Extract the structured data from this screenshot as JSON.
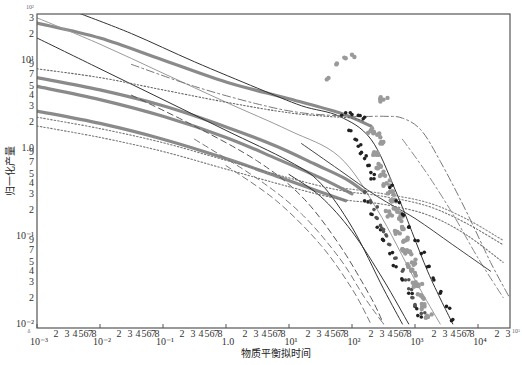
{
  "chart_data": {
    "type": "scatter",
    "title": "",
    "xlabel": "物质平衡拟时间",
    "ylabel": "归一化产量",
    "xscale": "log",
    "yscale": "log",
    "xlim": [
      0.001,
      30000
    ],
    "ylim": [
      0.01,
      34
    ],
    "grid": false,
    "legend": null,
    "x_major_ticks": [
      "10⁻³",
      "10⁻²",
      "10⁻¹",
      "1.0",
      "10¹",
      "10²",
      "10³",
      "10⁴"
    ],
    "x_minor_tick_labels": [
      "2",
      "3",
      "4",
      "5",
      "6",
      "7",
      "8"
    ],
    "x_trailing_minor_labels": [
      "2",
      "3"
    ],
    "y_major_ticks": [
      "10¹",
      "1.0",
      "10⁻¹",
      "10⁻²"
    ],
    "y_minor_tick_labels_per_decade": [
      "2",
      "3",
      "4",
      "5",
      "7",
      "9"
    ],
    "corner_marks": {
      "origin": "δ",
      "top_left": "10²",
      "bottom_right": "10⁵"
    },
    "series_note": "Type-curve family (solid thick gray, thin solid, dashed, dotted, dash-dot) with field data scatter (black, dark gray, light gray points); coordinates given as [log10(x), log10(y)]",
    "series": [
      {
        "name": "thick-gray-1",
        "style": "thick",
        "color": "#8a8a8a",
        "points": [
          [
            -3,
            0.42
          ],
          [
            -2,
            0.28
          ],
          [
            -1,
            0.1
          ],
          [
            0,
            -0.12
          ],
          [
            0.8,
            -0.32
          ],
          [
            1.5,
            -0.5
          ],
          [
            1.9,
            -0.6
          ]
        ]
      },
      {
        "name": "thick-gray-2",
        "style": "thick",
        "color": "#8a8a8a",
        "points": [
          [
            -3,
            0.8
          ],
          [
            -2,
            0.66
          ],
          [
            -1,
            0.48
          ],
          [
            0,
            0.24
          ],
          [
            0.8,
            0.02
          ],
          [
            1.4,
            -0.18
          ],
          [
            1.9,
            -0.35
          ],
          [
            2.2,
            -0.5
          ]
        ]
      },
      {
        "name": "thick-gray-3",
        "style": "thick",
        "color": "#8a8a8a",
        "points": [
          [
            -3,
            0.7
          ],
          [
            -2,
            0.55
          ],
          [
            -1,
            0.36
          ],
          [
            0,
            0.12
          ],
          [
            0.8,
            -0.12
          ],
          [
            1.5,
            -0.34
          ],
          [
            2.0,
            -0.52
          ]
        ]
      },
      {
        "name": "thick-gray-4",
        "style": "thick",
        "color": "#8a8a8a",
        "points": [
          [
            -3,
            1.42
          ],
          [
            -2,
            1.25
          ],
          [
            -1,
            1.0
          ],
          [
            0,
            0.75
          ],
          [
            1.0,
            0.56
          ],
          [
            1.8,
            0.4
          ],
          [
            2.3,
            0.25
          ]
        ]
      },
      {
        "name": "solid-black-1",
        "style": "thin",
        "color": "#333333",
        "points": [
          [
            -2.4,
            1.55
          ],
          [
            -1.5,
            1.3
          ],
          [
            -0.5,
            0.98
          ],
          [
            0.5,
            0.68
          ],
          [
            1.2,
            0.48
          ],
          [
            1.8,
            0.36
          ],
          [
            2.3,
            0.1
          ],
          [
            2.7,
            -0.5
          ],
          [
            3.2,
            -1.4
          ],
          [
            3.6,
            -2.0
          ]
        ]
      },
      {
        "name": "solid-black-2",
        "style": "thin",
        "color": "#333333",
        "points": [
          [
            -3,
            1.25
          ],
          [
            -2,
            0.9
          ],
          [
            -1,
            0.55
          ],
          [
            0,
            0.2
          ],
          [
            1,
            -0.15
          ],
          [
            1.5,
            -0.4
          ],
          [
            2.0,
            -0.9
          ],
          [
            2.5,
            -1.6
          ],
          [
            2.8,
            -2.0
          ]
        ]
      },
      {
        "name": "solid-black-3",
        "style": "thin",
        "color": "#333333",
        "points": [
          [
            1.0,
            -0.3
          ],
          [
            1.5,
            -0.55
          ],
          [
            2.0,
            -0.95
          ],
          [
            2.5,
            -1.5
          ],
          [
            2.9,
            -2.0
          ]
        ]
      },
      {
        "name": "thin-gray-1",
        "style": "thin",
        "color": "#9a9a9a",
        "points": [
          [
            -3,
            1.48
          ],
          [
            -2,
            1.18
          ],
          [
            -1,
            0.85
          ],
          [
            0,
            0.52
          ],
          [
            1,
            0.2
          ],
          [
            1.8,
            -0.1
          ],
          [
            2.4,
            -0.7
          ],
          [
            3.0,
            -1.5
          ],
          [
            3.4,
            -2.0
          ]
        ]
      },
      {
        "name": "dashed-1",
        "style": "dashed",
        "color": "#555555",
        "points": [
          [
            -1.5,
            0.6
          ],
          [
            -0.5,
            0.25
          ],
          [
            0.5,
            -0.15
          ],
          [
            1.2,
            -0.55
          ],
          [
            1.8,
            -1.1
          ],
          [
            2.3,
            -1.7
          ],
          [
            2.5,
            -2.0
          ]
        ]
      },
      {
        "name": "dashed-2",
        "style": "dashed",
        "color": "#777777",
        "points": [
          [
            -0.5,
            0.1
          ],
          [
            0.5,
            -0.35
          ],
          [
            1.2,
            -0.75
          ],
          [
            1.8,
            -1.25
          ],
          [
            2.2,
            -1.7
          ],
          [
            2.5,
            -2.0
          ]
        ]
      },
      {
        "name": "dashed-3",
        "style": "dashed",
        "color": "#777777",
        "points": [
          [
            0.0,
            -0.2
          ],
          [
            0.8,
            -0.6
          ],
          [
            1.5,
            -1.1
          ],
          [
            2.0,
            -1.6
          ],
          [
            2.3,
            -2.0
          ]
        ]
      },
      {
        "name": "dotted-1",
        "style": "dotted",
        "color": "#666666",
        "points": [
          [
            -3,
            0.9
          ],
          [
            -2,
            0.8
          ],
          [
            -1,
            0.66
          ],
          [
            0,
            0.52
          ],
          [
            1,
            0.4
          ],
          [
            1.6,
            0.36
          ],
          [
            2.0,
            0.34
          ],
          [
            2.2,
            0.3
          ]
        ]
      },
      {
        "name": "dotted-2",
        "style": "dotted",
        "color": "#777777",
        "points": [
          [
            -3,
            0.35
          ],
          [
            -2,
            0.22
          ],
          [
            -1,
            0.06
          ],
          [
            0,
            -0.14
          ],
          [
            1,
            -0.34
          ],
          [
            1.8,
            -0.48
          ],
          [
            2.5,
            -0.55
          ],
          [
            3.2,
            -0.66
          ],
          [
            3.8,
            -0.85
          ],
          [
            4.4,
            -1.1
          ]
        ]
      },
      {
        "name": "dotted-3",
        "style": "dotted",
        "color": "#777777",
        "points": [
          [
            -3,
            0.25
          ],
          [
            -2,
            0.12
          ],
          [
            -1,
            -0.04
          ],
          [
            0,
            -0.24
          ],
          [
            1,
            -0.44
          ],
          [
            1.8,
            -0.58
          ],
          [
            2.5,
            -0.64
          ],
          [
            3.2,
            -0.76
          ],
          [
            3.8,
            -0.98
          ],
          [
            4.4,
            -1.3
          ]
        ]
      },
      {
        "name": "dotted-4",
        "style": "dotted",
        "color": "#888888",
        "points": [
          [
            1.8,
            -0.45
          ],
          [
            2.5,
            -0.52
          ],
          [
            3.2,
            -0.62
          ],
          [
            3.8,
            -0.8
          ],
          [
            4.4,
            -1.05
          ]
        ]
      },
      {
        "name": "dash-dot-plateau",
        "style": "dashdot",
        "color": "#777777",
        "points": [
          [
            -1.5,
            0.95
          ],
          [
            -0.5,
            0.7
          ],
          [
            0.5,
            0.5
          ],
          [
            1.2,
            0.4
          ],
          [
            2.0,
            0.36
          ],
          [
            2.5,
            0.36
          ],
          [
            2.8,
            0.34
          ],
          [
            3.1,
            0.2
          ],
          [
            3.4,
            -0.15
          ],
          [
            3.8,
            -0.7
          ],
          [
            4.2,
            -1.3
          ],
          [
            4.5,
            -1.7
          ]
        ]
      },
      {
        "name": "dash-dot-long",
        "style": "dashdot",
        "color": "#888888",
        "points": [
          [
            2.8,
            0.1
          ],
          [
            3.2,
            -0.3
          ],
          [
            3.6,
            -0.75
          ],
          [
            4.0,
            -1.25
          ],
          [
            4.4,
            -1.7
          ]
        ]
      },
      {
        "name": "solid-dark-long",
        "style": "thin",
        "color": "#444444",
        "points": [
          [
            1.2,
            0.05
          ],
          [
            1.8,
            -0.25
          ],
          [
            2.4,
            -0.55
          ],
          [
            3.0,
            -0.8
          ],
          [
            3.6,
            -1.1
          ],
          [
            4.2,
            -1.4
          ]
        ]
      }
    ],
    "scatter": [
      {
        "name": "field-data-black",
        "color": "#222222",
        "points": [
          [
            1.9,
            0.4
          ],
          [
            2.0,
            0.38
          ],
          [
            2.1,
            0.37
          ],
          [
            2.2,
            0.35
          ],
          [
            1.95,
            0.2
          ],
          [
            2.05,
            0.1
          ],
          [
            2.1,
            0.02
          ],
          [
            2.15,
            -0.05
          ],
          [
            2.2,
            -0.12
          ],
          [
            2.25,
            -0.2
          ],
          [
            2.3,
            -0.28
          ],
          [
            2.35,
            -0.35
          ],
          [
            2.2,
            -0.6
          ],
          [
            2.3,
            -0.75
          ],
          [
            2.4,
            -0.9
          ],
          [
            2.5,
            -1.05
          ],
          [
            2.6,
            -1.2
          ],
          [
            2.7,
            -1.35
          ],
          [
            2.8,
            -1.5
          ],
          [
            2.9,
            -1.65
          ],
          [
            3.0,
            -1.8
          ],
          [
            3.1,
            -1.92
          ]
        ]
      },
      {
        "name": "field-data-dark-gray",
        "color": "#555555",
        "points": [
          [
            2.2,
            -0.5
          ],
          [
            2.3,
            -0.62
          ],
          [
            2.35,
            -0.7
          ],
          [
            2.4,
            -0.8
          ],
          [
            2.45,
            -0.88
          ],
          [
            2.5,
            -0.95
          ],
          [
            2.55,
            -1.0
          ],
          [
            2.6,
            -1.1
          ],
          [
            2.7,
            -1.25
          ],
          [
            2.8,
            -1.4
          ],
          [
            2.85,
            -1.5
          ],
          [
            2.9,
            -1.6
          ],
          [
            2.95,
            -1.7
          ],
          [
            3.0,
            -1.78
          ],
          [
            3.1,
            -1.88
          ]
        ]
      },
      {
        "name": "field-data-light-gray",
        "color": "#9a9a9a",
        "points": [
          [
            1.6,
            0.78
          ],
          [
            1.75,
            0.95
          ],
          [
            1.9,
            1.02
          ],
          [
            2.0,
            1.06
          ],
          [
            2.5,
            0.55
          ],
          [
            2.3,
            0.2
          ],
          [
            2.4,
            0.15
          ],
          [
            2.45,
            0.05
          ],
          [
            2.4,
            -0.05
          ],
          [
            2.45,
            -0.2
          ],
          [
            2.5,
            -0.3
          ],
          [
            2.55,
            -0.4
          ],
          [
            2.6,
            -0.5
          ],
          [
            2.65,
            -0.6
          ],
          [
            2.7,
            -0.7
          ],
          [
            2.75,
            -0.8
          ],
          [
            2.8,
            -0.92
          ],
          [
            2.85,
            -1.05
          ],
          [
            2.9,
            -1.18
          ],
          [
            2.95,
            -1.3
          ],
          [
            3.0,
            -1.42
          ],
          [
            3.05,
            -1.55
          ],
          [
            3.1,
            -1.68
          ],
          [
            3.15,
            -1.8
          ],
          [
            3.2,
            -1.92
          ],
          [
            2.6,
            -0.75
          ],
          [
            2.7,
            -0.95
          ],
          [
            2.8,
            -1.15
          ],
          [
            2.9,
            -1.35
          ],
          [
            3.0,
            -1.55
          ]
        ]
      },
      {
        "name": "field-data-black-line",
        "color": "#1e1e1e",
        "points": [
          [
            2.6,
            -0.45
          ],
          [
            2.7,
            -0.6
          ],
          [
            2.8,
            -0.75
          ],
          [
            2.9,
            -0.9
          ],
          [
            3.0,
            -1.05
          ],
          [
            3.1,
            -1.2
          ],
          [
            3.2,
            -1.35
          ],
          [
            3.3,
            -1.5
          ],
          [
            3.4,
            -1.65
          ],
          [
            3.5,
            -1.8
          ],
          [
            3.6,
            -1.95
          ]
        ]
      }
    ]
  },
  "axes": {
    "x_title": "物质平衡拟时间",
    "y_title": "归一化产量"
  }
}
